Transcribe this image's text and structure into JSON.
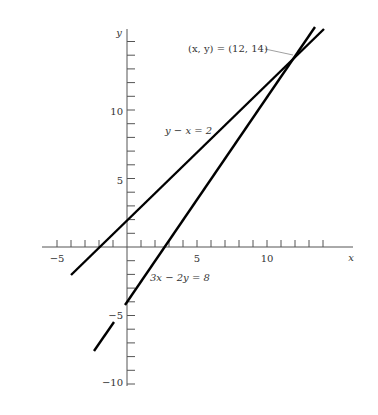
{
  "chart_data": {
    "type": "line",
    "title": "",
    "xlabel": "x",
    "ylabel": "y",
    "xlim": [
      -6,
      16
    ],
    "ylim": [
      -11,
      16
    ],
    "x_ticks": [
      -5,
      5,
      10
    ],
    "y_ticks": [
      -10,
      -5,
      5,
      10
    ],
    "x_minor_step": 1,
    "y_minor_step": 1,
    "grid": false,
    "series": [
      {
        "name": "y − x = 2",
        "equation": "y - x = 2",
        "x": [
          -4,
          14
        ],
        "y": [
          -2,
          16
        ]
      },
      {
        "name": "3x − 2y = 8",
        "equation": "3x - 2y = 8",
        "x": [
          -2.4,
          13.4
        ],
        "y": [
          -7.6,
          16.1
        ]
      }
    ],
    "annotations": [
      {
        "text": "(x, y) = (12, 14)",
        "x": 12,
        "y": 14
      },
      {
        "text": "y − x = 2",
        "x": 5,
        "y": 9
      },
      {
        "text": "3x − 2y = 8",
        "x": 3.5,
        "y": -2
      }
    ],
    "intersection": {
      "x": 12,
      "y": 14
    }
  },
  "labels": {
    "x_axis": "x",
    "y_axis": "y",
    "tick_x_neg5": "−5",
    "tick_x_5": "5",
    "tick_x_10": "10",
    "tick_y_10": "10",
    "tick_y_5": "5",
    "tick_y_neg5": "−5",
    "tick_y_neg10": "−10",
    "line1": "y − x = 2",
    "line2": "3x − 2y = 8",
    "intersection": "(x, y) = (12, 14)"
  }
}
